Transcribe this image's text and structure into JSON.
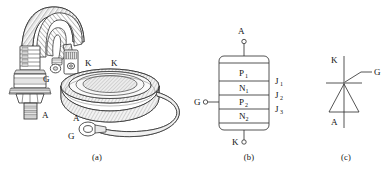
{
  "figure": {
    "type": "thyristor-illustration",
    "panels": [
      {
        "id": "a",
        "caption": "(a)",
        "description": "photographs of stud-mount and disc-type thyristors",
        "labels": [
          {
            "text": "G",
            "role": "gate-lead"
          },
          {
            "text": "K",
            "role": "cathode-lead"
          },
          {
            "text": "A",
            "role": "anode-stud"
          },
          {
            "text": "K",
            "role": "cathode-disc"
          },
          {
            "text": "A",
            "role": "anode-disc"
          },
          {
            "text": "G",
            "role": "gate-disc"
          }
        ]
      },
      {
        "id": "b",
        "caption": "(b)",
        "description": "four-layer PNPN semiconductor structure",
        "terminals": {
          "anode": "A",
          "gate": "G",
          "cathode": "K"
        },
        "layers": [
          {
            "base": "P",
            "sub": "1"
          },
          {
            "base": "N",
            "sub": "1"
          },
          {
            "base": "P",
            "sub": "2"
          },
          {
            "base": "N",
            "sub": "2"
          }
        ],
        "junctions": [
          {
            "base": "J",
            "sub": "1"
          },
          {
            "base": "J",
            "sub": "2"
          },
          {
            "base": "J",
            "sub": "3"
          }
        ]
      },
      {
        "id": "c",
        "caption": "(c)",
        "description": "thyristor circuit symbol",
        "terminals": {
          "cathode": "K",
          "gate": "G",
          "anode": "A"
        }
      }
    ]
  },
  "colors": {
    "background": "#ffffff",
    "ink": "#2a2a2a",
    "shade_light": "#e9e9e9",
    "shade_mid": "#d8d8d8"
  }
}
